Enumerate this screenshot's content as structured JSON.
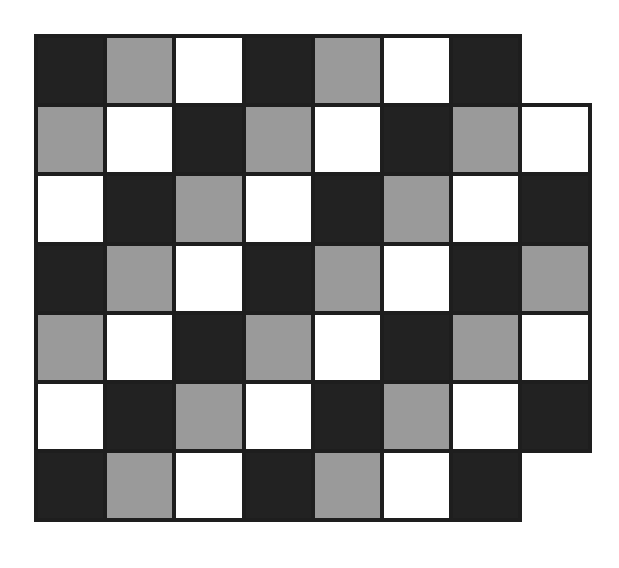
{
  "diagram": {
    "title": "",
    "colors": {
      "black": "#222222",
      "gray": "#9a9a9a",
      "white": "#ffffff",
      "border": "#1e1e1e"
    },
    "origin": {
      "x": 34,
      "y": 34
    },
    "cell_size": 72,
    "rows": [
      [
        "black",
        "gray",
        "white",
        "black",
        "gray",
        "white",
        "black"
      ],
      [
        "gray",
        "white",
        "black",
        "gray",
        "white",
        "black",
        "gray",
        "white"
      ],
      [
        "white",
        "black",
        "gray",
        "white",
        "black",
        "gray",
        "white",
        "black"
      ],
      [
        "black",
        "gray",
        "white",
        "black",
        "gray",
        "white",
        "black",
        "gray"
      ],
      [
        "gray",
        "white",
        "black",
        "gray",
        "white",
        "black",
        "gray",
        "white"
      ],
      [
        "white",
        "black",
        "gray",
        "white",
        "black",
        "gray",
        "white",
        "black"
      ],
      [
        "black",
        "gray",
        "white",
        "black",
        "gray",
        "white",
        "black"
      ]
    ]
  }
}
